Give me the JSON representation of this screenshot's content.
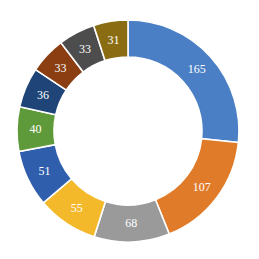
{
  "chart_data": {
    "type": "pie",
    "subtype": "donut",
    "title": "",
    "categories": [
      "A",
      "B",
      "C",
      "D",
      "E",
      "F",
      "G",
      "H",
      "I",
      "J"
    ],
    "values": [
      165,
      107,
      68,
      55,
      51,
      40,
      36,
      33,
      33,
      31
    ],
    "labels": [
      "165",
      "107",
      "68",
      "55",
      "51",
      "40",
      "36",
      "33",
      "33",
      "31"
    ],
    "colors": [
      "#4a7fc5",
      "#e07b2a",
      "#9a9a9a",
      "#f4b92a",
      "#2f5ead",
      "#5f9a3a",
      "#1f4578",
      "#8a3e12",
      "#4d4d4d",
      "#8a6d12"
    ],
    "start_angle_deg": 0,
    "direction": "clockwise",
    "legend": "none",
    "data_labels": "inside, white"
  },
  "geometry": {
    "cx": 128,
    "cy": 131,
    "outer_r": 111,
    "inner_r": 74,
    "gap": 1.6
  }
}
